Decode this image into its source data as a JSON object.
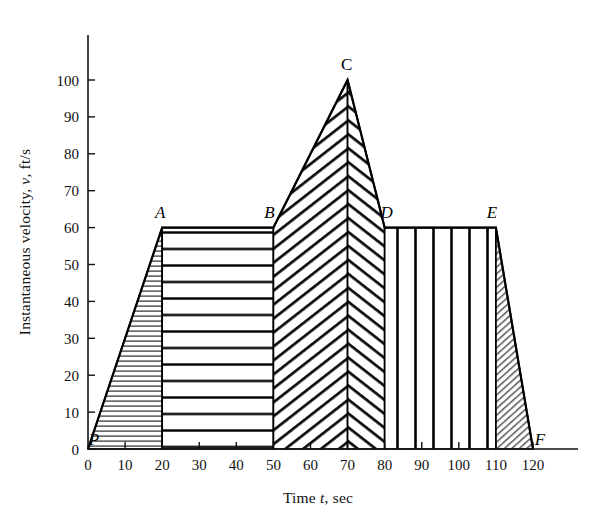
{
  "figure": {
    "background_color": "#ffffff",
    "ink_color": "#000000"
  },
  "chart_data": {
    "type": "area",
    "title": "",
    "xlabel_parts": {
      "lead": "Time ",
      "symbol": "t",
      "trail": ", sec"
    },
    "ylabel_parts": {
      "lead": "Instantaneous velocity, ",
      "symbol": "v",
      "trail": ", ft/s"
    },
    "xlabel": "Time t, sec",
    "ylabel": "Instantaneous velocity, v, ft/s",
    "xlim": [
      0,
      128
    ],
    "ylim": [
      0,
      108
    ],
    "xticks": [
      0,
      10,
      20,
      30,
      40,
      50,
      60,
      70,
      80,
      90,
      100,
      110,
      120
    ],
    "yticks": [
      0,
      10,
      20,
      30,
      40,
      50,
      60,
      70,
      80,
      90,
      100
    ],
    "xtick_labels": [
      "0",
      "10",
      "20",
      "30",
      "40",
      "50",
      "60",
      "70",
      "80",
      "90",
      "100",
      "110",
      "120"
    ],
    "ytick_labels": [
      "0",
      "10",
      "20",
      "30",
      "40",
      "50",
      "60",
      "70",
      "80",
      "90",
      "100"
    ],
    "grid": false,
    "legend": null,
    "x": [
      0,
      20,
      50,
      70,
      80,
      110,
      120
    ],
    "values": [
      0,
      60,
      60,
      100,
      60,
      60,
      0
    ],
    "points": [
      {
        "label": "P",
        "t": 0,
        "v": 0,
        "style": "italic",
        "label_dx": 6,
        "label_dy": -4
      },
      {
        "label": "A",
        "t": 20,
        "v": 60,
        "style": "italic",
        "label_dx": -2,
        "label_dy": -10
      },
      {
        "label": "B",
        "t": 50,
        "v": 60,
        "style": "italic",
        "label_dx": -4,
        "label_dy": -10
      },
      {
        "label": "C",
        "t": 70,
        "v": 100,
        "style": "upright",
        "label_dx": -1,
        "label_dy": -10
      },
      {
        "label": "D",
        "t": 80,
        "v": 60,
        "style": "italic",
        "label_dx": 2,
        "label_dy": -10
      },
      {
        "label": "E",
        "t": 110,
        "v": 60,
        "style": "italic",
        "label_dx": -4,
        "label_dy": -10
      },
      {
        "label": "F",
        "t": 120,
        "v": 0,
        "style": "italic",
        "label_dx": 7,
        "label_dy": -4
      }
    ],
    "regions": [
      {
        "name": "P-A",
        "from_t": 0,
        "to_t": 20,
        "hatch": "horizontal-fine"
      },
      {
        "name": "A-B",
        "from_t": 20,
        "to_t": 50,
        "hatch": "horizontal-coarse"
      },
      {
        "name": "B-C",
        "from_t": 50,
        "to_t": 70,
        "hatch": "diagonal-up-coarse"
      },
      {
        "name": "C-D",
        "from_t": 70,
        "to_t": 80,
        "hatch": "diagonal-down-coarse"
      },
      {
        "name": "D-E",
        "from_t": 80,
        "to_t": 110,
        "hatch": "vertical-coarse"
      },
      {
        "name": "E-F",
        "from_t": 110,
        "to_t": 120,
        "hatch": "diagonal-up-fine"
      }
    ]
  }
}
